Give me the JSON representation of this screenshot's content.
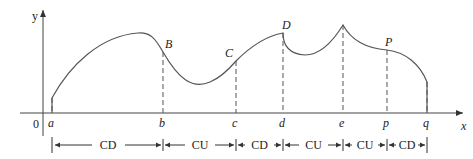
{
  "axes": {
    "x_label": "x",
    "y_label": "y",
    "origin_label": "0"
  },
  "x_ticks": [
    {
      "label": "a",
      "x": 52
    },
    {
      "label": "b",
      "x": 163
    },
    {
      "label": "c",
      "x": 236
    },
    {
      "label": "d",
      "x": 283
    },
    {
      "label": "e",
      "x": 343
    },
    {
      "label": "p",
      "x": 387
    },
    {
      "label": "q",
      "x": 427
    }
  ],
  "points": [
    {
      "label": "B",
      "x": 163,
      "y": 52
    },
    {
      "label": "C",
      "x": 236,
      "y": 61
    },
    {
      "label": "D",
      "x": 283,
      "y": 33
    },
    {
      "label": "P",
      "x": 387,
      "y": 50
    }
  ],
  "intervals": [
    {
      "label": "CD",
      "from": "a",
      "to": "b"
    },
    {
      "label": "CU",
      "from": "b",
      "to": "c"
    },
    {
      "label": "CD",
      "from": "c",
      "to": "d"
    },
    {
      "label": "CU",
      "from": "d",
      "to": "e"
    },
    {
      "label": "CU",
      "from": "e",
      "to": "p"
    },
    {
      "label": "CD",
      "from": "p",
      "to": "q"
    }
  ],
  "colors": {
    "curve": "#555555",
    "axis": "#444444",
    "text": "#222222"
  }
}
